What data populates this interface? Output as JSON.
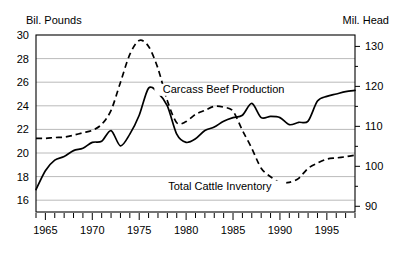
{
  "axes": {
    "left_unit_label": "Bil. Pounds",
    "right_unit_label": "Mil. Head"
  },
  "chart_data": {
    "type": "line",
    "title": "",
    "subtitle": "",
    "xlabel": "",
    "ylabel": "Bil. Pounds",
    "y2label": "Mil. Head",
    "grid": true,
    "legend_position": "inline-annotation",
    "xlim": [
      1964,
      1998
    ],
    "ylim": [
      15,
      30
    ],
    "y2lim": [
      88.571,
      132.857
    ],
    "xticks_labeled": [
      1965,
      1970,
      1975,
      1980,
      1985,
      1990,
      1995
    ],
    "xticks_minor_every": 1,
    "yticks_left": [
      16,
      18,
      20,
      22,
      24,
      26,
      28,
      30
    ],
    "yticks_right": [
      90,
      100,
      110,
      120,
      130
    ],
    "yticks_right_minor": [
      95,
      105,
      115,
      125
    ],
    "x": [
      1964,
      1965,
      1966,
      1967,
      1968,
      1969,
      1970,
      1971,
      1972,
      1973,
      1974,
      1975,
      1976,
      1977,
      1978,
      1979,
      1980,
      1981,
      1982,
      1983,
      1984,
      1985,
      1986,
      1987,
      1988,
      1989,
      1990,
      1991,
      1992,
      1993,
      1994,
      1995,
      1996,
      1997,
      1998
    ],
    "series": [
      {
        "name": "Carcass Beef Production",
        "axis": "left",
        "unit": "Bil. Pounds",
        "style": "solid",
        "values": [
          16.9,
          18.5,
          19.4,
          19.7,
          20.2,
          20.4,
          20.9,
          21.0,
          21.9,
          20.6,
          21.6,
          23.2,
          25.5,
          25.1,
          24.0,
          21.6,
          20.9,
          21.2,
          21.9,
          22.2,
          22.7,
          23.0,
          23.2,
          24.2,
          23.0,
          23.1,
          23.0,
          22.4,
          22.6,
          22.7,
          24.4,
          24.8,
          25.0,
          25.2,
          25.3
        ]
      },
      {
        "name": "Total Cattle Inventory",
        "axis": "right",
        "unit": "Mil. Head",
        "style": "dashed",
        "values": [
          107.0,
          107.0,
          107.2,
          107.3,
          107.8,
          108.4,
          109.0,
          110.5,
          114.0,
          121.0,
          128.0,
          131.5,
          130.0,
          124.5,
          116.4,
          110.9,
          111.2,
          113.0,
          114.0,
          115.0,
          114.8,
          113.8,
          109.0,
          104.5,
          99.5,
          97.4,
          96.0,
          96.0,
          97.0,
          99.5,
          100.8,
          101.8,
          102.1,
          102.4,
          102.8
        ]
      }
    ],
    "annotations": [
      {
        "text": "Carcass Beef Production",
        "x": 1984.0,
        "y": 25.1,
        "axis": "left"
      },
      {
        "text": "Total Cattle Inventory",
        "x": 1983.6,
        "y": 16.9,
        "axis": "left"
      }
    ]
  }
}
